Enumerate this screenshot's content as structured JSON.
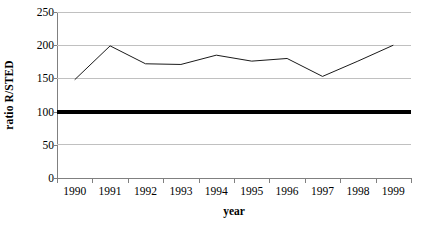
{
  "chart_data": {
    "type": "line",
    "title": "",
    "xlabel": "year",
    "ylabel": "ratio R/STED",
    "categories": [
      "1990",
      "1991",
      "1992",
      "1993",
      "1994",
      "1995",
      "1996",
      "1997",
      "1998",
      "1999"
    ],
    "series": [
      {
        "name": "ratio R/STED",
        "values": [
          148,
          199,
          172,
          171,
          185,
          176,
          180,
          153,
          176,
          200
        ],
        "color": "#1a1a1a",
        "line_width": 1
      }
    ],
    "reference_lines": [
      {
        "name": "baseline-100",
        "value": 100,
        "color": "#000000",
        "line_width": 4
      }
    ],
    "ylim": [
      0,
      250
    ],
    "yticks": [
      0,
      50,
      100,
      150,
      200,
      250
    ],
    "ytick_labels": [
      "0",
      "50",
      "100",
      "150",
      "200",
      "250"
    ],
    "grid": true,
    "grid_axis": "y",
    "grid_color": "#c0c0c0",
    "axis_color": "#808080",
    "background": "#ffffff",
    "legend": null,
    "legend_position": "none"
  }
}
